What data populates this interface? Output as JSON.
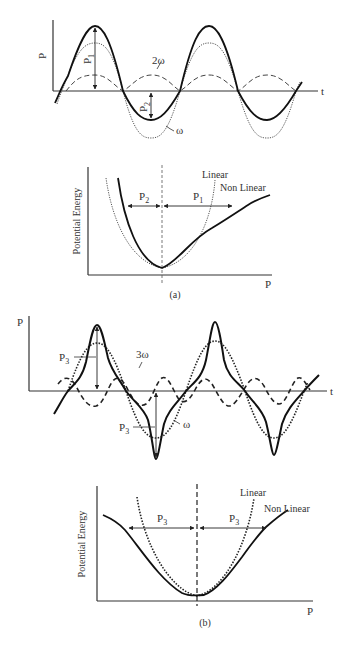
{
  "figure": {
    "panel_a": {
      "caption": "(a)",
      "wave_plot": {
        "y_axis_label": "P",
        "x_axis_label": "t",
        "curve_labels": {
          "fundamental": "ω",
          "harmonic": "2ω"
        },
        "amplitude_labels": {
          "positive": "P",
          "positive_sub": "1",
          "negative": "P",
          "negative_sub": "2"
        }
      },
      "energy_plot": {
        "y_axis_label": "Potential Energy",
        "x_axis_label": "P",
        "legend": {
          "linear": "Linear",
          "nonlinear": "Non Linear"
        },
        "span_labels": {
          "left": "P",
          "left_sub": "2",
          "right": "P",
          "right_sub": "1"
        }
      }
    },
    "panel_b": {
      "caption": "(b)",
      "wave_plot": {
        "y_axis_label": "P",
        "x_axis_label": "t",
        "curve_labels": {
          "fundamental": "ω",
          "harmonic": "3ω"
        },
        "amplitude_labels": {
          "positive": "P",
          "positive_sub": "3",
          "negative": "P",
          "negative_sub": "3"
        }
      },
      "energy_plot": {
        "y_axis_label": "Potential Energy",
        "x_axis_label": "P",
        "legend": {
          "linear": "Linear",
          "nonlinear": "Non Linear"
        },
        "span_labels": {
          "left": "P",
          "left_sub": "3",
          "right": "P",
          "right_sub": "3"
        }
      }
    }
  }
}
